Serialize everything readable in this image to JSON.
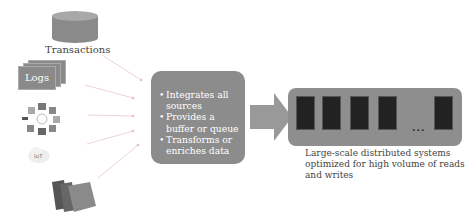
{
  "sources": {
    "database": {
      "label": "Transactions",
      "icon": "database-cylinder-icon"
    },
    "logs": {
      "label": "Logs",
      "icon": "stacked-documents-icon"
    },
    "network": {
      "icon": "hub-network-icon"
    },
    "cloud": {
      "icon": "cloud-icon",
      "label": "IoT"
    },
    "files": {
      "icon": "folders-icon"
    }
  },
  "integration_layer": {
    "bullets": [
      "Integrates all sources",
      "Provides a buffer or queue",
      "Transforms or enriches data"
    ]
  },
  "flow_arrow": {
    "icon": "right-arrow-icon"
  },
  "storage_cluster": {
    "node_count_shown": 5,
    "ellipsis": "...",
    "caption": "Large-scale distributed systems optimized for high volume of reads and writes"
  },
  "colors": {
    "box_fill": "#8c8c8c",
    "node_fill": "#222222",
    "line": "#e3b7b7"
  }
}
